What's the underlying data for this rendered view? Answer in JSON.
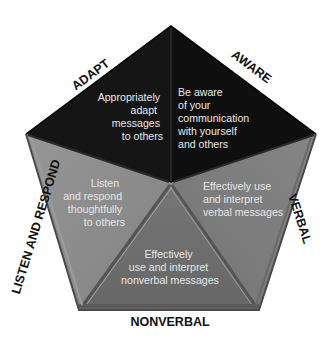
{
  "diagram": {
    "type": "pentagon",
    "colors": {
      "adapt_face": "#151515",
      "aware_face": "#111111",
      "listen_face": "#8c8c8c",
      "nonverbal_face": "#6f6f6f",
      "verbal_face": "#7c7c7c",
      "face_text_dark": "#e8e8e8",
      "face_text_light": "#e4e4e4",
      "edge_label": "#111111"
    },
    "segments": [
      {
        "id": "adapt",
        "edge_label": "ADAPT",
        "lines": [
          "Appropriately",
          "adapt",
          "messages",
          "to others"
        ]
      },
      {
        "id": "aware",
        "edge_label": "AWARE",
        "lines": [
          "Be aware",
          "of your",
          "communication",
          "with yourself",
          "and others"
        ]
      },
      {
        "id": "verbal",
        "edge_label": "VERBAL",
        "lines": [
          "Effectively use",
          "and interpret",
          "verbal messages"
        ]
      },
      {
        "id": "nonverbal",
        "edge_label": "NONVERBAL",
        "lines": [
          "Effectively",
          "use and interpret",
          "nonverbal messages"
        ]
      },
      {
        "id": "listen",
        "edge_label": "LISTEN AND RESPOND",
        "lines": [
          "Listen",
          "and respond",
          "thoughtfully",
          "to others"
        ]
      }
    ]
  }
}
